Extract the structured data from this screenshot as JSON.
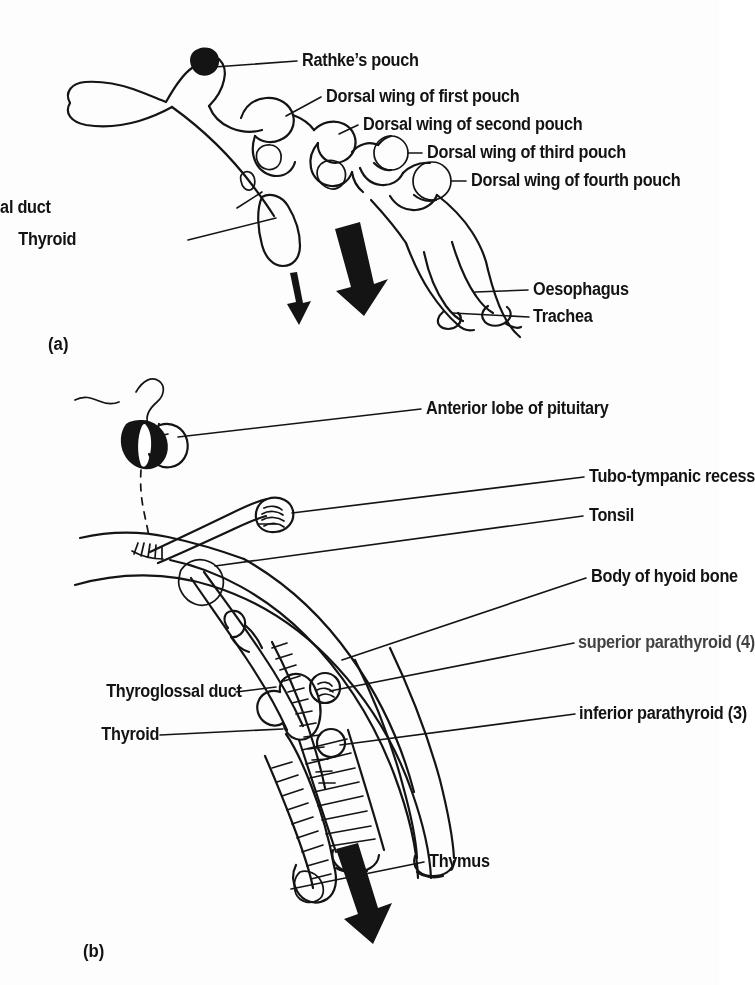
{
  "figure": {
    "type": "anatomical-line-diagram",
    "background_color": "#fdfdfd",
    "ink_color": "#141414",
    "panels": [
      {
        "id": "a",
        "caption": "(a)",
        "description": "Early embryonic pharynx showing Rathke's pouch, the dorsal wings of the first to fourth pharyngeal pouches, the thyroglossal duct and descending thyroid, with oesophagus and trachea.",
        "labels": [
          {
            "key": "rathkes_pouch",
            "text": "Rathke’s pouch",
            "side": "right"
          },
          {
            "key": "pouch1",
            "text": "Dorsal wing of first pouch",
            "side": "right"
          },
          {
            "key": "pouch2",
            "text": "Dorsal wing of second pouch",
            "side": "right"
          },
          {
            "key": "pouch3",
            "text": "Dorsal wing of third pouch",
            "side": "right"
          },
          {
            "key": "pouch4",
            "text": "Dorsal wing of fourth pouch",
            "side": "right"
          },
          {
            "key": "thyroglossal",
            "text": "Thyroglossal duct",
            "side": "left"
          },
          {
            "key": "thyroid",
            "text": "Thyroid",
            "side": "left"
          },
          {
            "key": "oesophagus",
            "text": "Oesophagus",
            "side": "right"
          },
          {
            "key": "trachea",
            "text": "Trachea",
            "side": "right"
          }
        ]
      },
      {
        "id": "b",
        "caption": "(b)",
        "description": "Later stage showing descent of the derivatives: anterior lobe of pituitary, tubo-tympanic recess, tonsil, body of hyoid bone, superior and inferior parathyroids, thyroglossal duct, thyroid and thymus.",
        "labels": [
          {
            "key": "pituitary",
            "text": "Anterior lobe of pituitary",
            "side": "right"
          },
          {
            "key": "tubotympanic",
            "text": "Tubo-tympanic recess",
            "side": "right"
          },
          {
            "key": "tonsil",
            "text": "Tonsil",
            "side": "right"
          },
          {
            "key": "hyoid",
            "text": "Body of hyoid bone",
            "side": "right"
          },
          {
            "key": "sup_parathyroid",
            "text": "superior parathyroid (4)",
            "side": "right",
            "degraded": true
          },
          {
            "key": "inf_parathyroid",
            "text": "inferior parathyroid (3)",
            "side": "right"
          },
          {
            "key": "thyroglossal",
            "text": "Thyroglossal duct",
            "side": "left"
          },
          {
            "key": "thyroid",
            "text": "Thyroid",
            "side": "left"
          },
          {
            "key": "thymus",
            "text": "Thymus",
            "side": "right"
          }
        ]
      }
    ]
  }
}
